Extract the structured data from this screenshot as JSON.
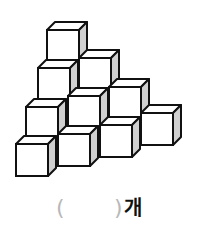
{
  "figure": {
    "cube_count_visible_rows": [
      1,
      2,
      3,
      4
    ],
    "colors": {
      "stroke": "#111111",
      "face": "#ffffff",
      "side": "#d0d0d0"
    }
  },
  "answer": {
    "open_paren": "(",
    "blank": "",
    "close_paren": ")",
    "unit": "개"
  }
}
